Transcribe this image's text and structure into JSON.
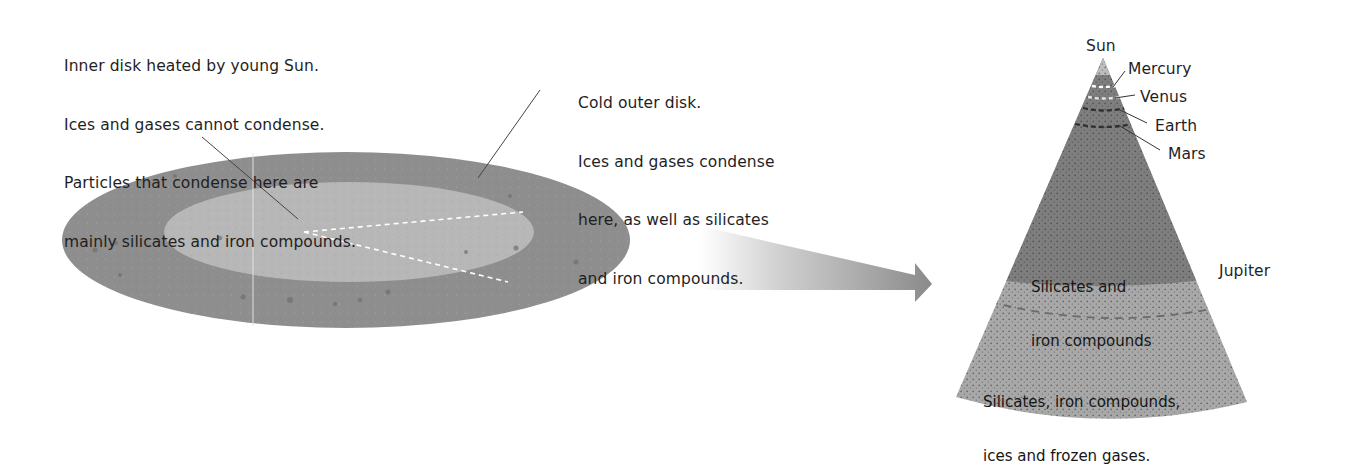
{
  "diagram": {
    "type": "solar-nebula-condensation",
    "disk": {
      "inner_annotation": {
        "lines": [
          "Inner disk heated by young Sun.",
          "Ices and gases cannot condense.",
          "Particles that condense here are",
          "mainly silicates and iron compounds."
        ]
      },
      "outer_annotation": {
        "lines": [
          "Cold outer disk.",
          "Ices and gases condense",
          "here, as well as silicates",
          "and iron compounds."
        ]
      },
      "colors": {
        "outer_disk": "#8c8c8c",
        "inner_disk": "#b5b5b5",
        "dashes": "#ffffff",
        "leader": "#444444"
      }
    },
    "arrow": {
      "direction": "right",
      "color": "#8a8a8a"
    },
    "cone": {
      "apex_label": "Sun",
      "planets": [
        {
          "name": "Mercury"
        },
        {
          "name": "Venus"
        },
        {
          "name": "Earth"
        },
        {
          "name": "Mars"
        },
        {
          "name": "Jupiter"
        }
      ],
      "zones": [
        {
          "label_lines": [
            "Silicates and",
            "iron compounds"
          ],
          "color": "#7d7d7d"
        },
        {
          "label_lines": [
            "Silicates, iron compounds,",
            "ices and frozen gases."
          ],
          "color": "#a9a9a9"
        }
      ]
    }
  }
}
